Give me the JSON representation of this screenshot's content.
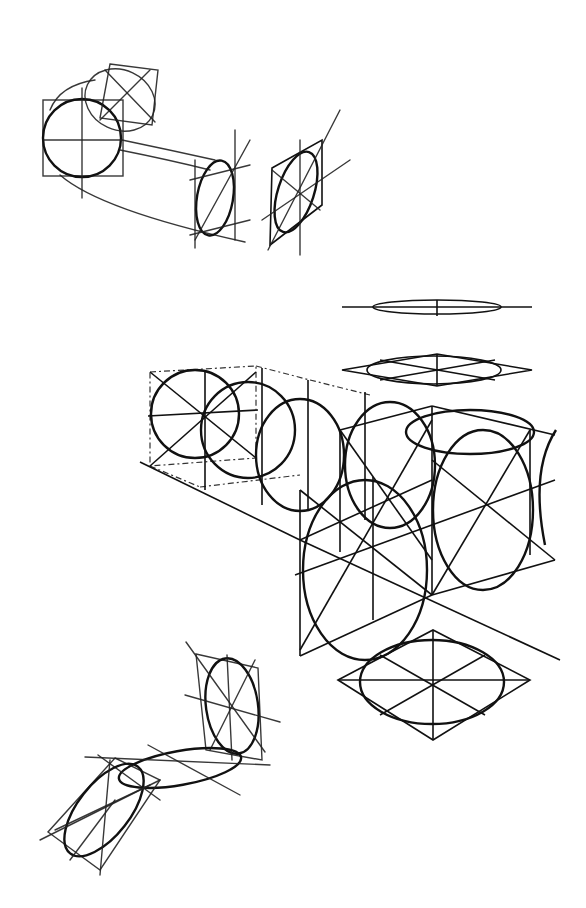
{
  "figure": {
    "type": "drawing-instruction",
    "groups": [
      {
        "id": "top-sketch",
        "description": "Freehand cylinder sketch with circles in squares"
      },
      {
        "id": "center-construction",
        "description": "Ruled construction of ellipses in cube faces with flattening ellipses above"
      },
      {
        "id": "bottom-sketch",
        "description": "Freehand bent cylinder with ellipses in rhombuses"
      }
    ]
  }
}
